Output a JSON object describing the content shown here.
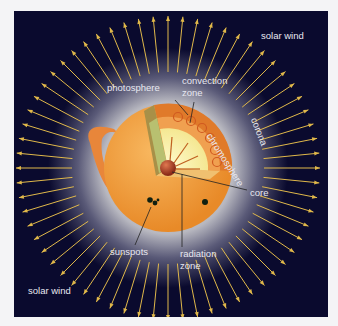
{
  "diagram": {
    "labels": {
      "solar_wind_top": "solar wind",
      "solar_wind_bottom": "solar wind",
      "photosphere": "photosphere",
      "convection_zone_line1": "convection",
      "convection_zone_line2": "zone",
      "chromosphere": "chromosphere",
      "corona": "corona",
      "core": "core",
      "sunspots": "sunspots",
      "radiation_zone_line1": "radiation",
      "radiation_zone_line2": "zone"
    },
    "colors": {
      "background": "#0a0a2e",
      "arrow": "#e0b84a",
      "sun_surface": "#f0a040",
      "radiation_zone": "#f6f0a0",
      "core": "#b04020",
      "label_text": "#e8e8f0"
    },
    "arrow_count": 64
  }
}
